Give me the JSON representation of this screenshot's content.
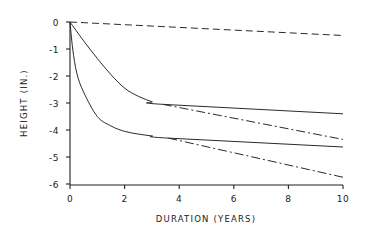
{
  "chart_data": {
    "type": "line",
    "title": "",
    "xlabel": "DURATION (YEARS)",
    "ylabel": "HEIGHT (IN.)",
    "xlim": [
      0,
      10
    ],
    "ylim": [
      -6,
      0
    ],
    "x_ticks": [
      0,
      2,
      4,
      6,
      8,
      10
    ],
    "x_tick_labels": [
      "0",
      "2",
      "4",
      "6",
      "8",
      "10"
    ],
    "y_ticks": [
      0,
      -1,
      -2,
      -3,
      -4,
      -5,
      -6
    ],
    "y_tick_labels": [
      "0",
      "-1",
      "-2",
      "-3",
      "-4",
      "-5",
      "-6"
    ],
    "grid": false,
    "legend": null,
    "series": [
      {
        "name": "dashed-top",
        "style": "dashed",
        "x": [
          0,
          10
        ],
        "y": [
          0,
          -0.5
        ]
      },
      {
        "name": "upper-solid",
        "style": "solid",
        "x": [
          0,
          0.5,
          1,
          1.5,
          2,
          2.5,
          3,
          3.4,
          10
        ],
        "y": [
          0,
          -0.7,
          -1.35,
          -1.95,
          -2.45,
          -2.75,
          -2.95,
          -3.05,
          -3.4
        ]
      },
      {
        "name": "upper-dashdot",
        "style": "dash-dot",
        "x": [
          3.4,
          10
        ],
        "y": [
          -3.05,
          -4.35
        ]
      },
      {
        "name": "lower-solid",
        "style": "solid",
        "x": [
          0,
          0.1,
          0.25,
          0.5,
          1,
          1.5,
          2,
          2.5,
          3,
          3.6,
          10
        ],
        "y": [
          0,
          -1.0,
          -1.9,
          -2.6,
          -3.5,
          -3.85,
          -4.05,
          -4.15,
          -4.22,
          -4.3,
          -4.63
        ]
      },
      {
        "name": "lower-dashdot",
        "style": "dash-dot",
        "x": [
          3.6,
          10
        ],
        "y": [
          -4.3,
          -5.75
        ]
      }
    ]
  },
  "axes": {
    "x_title": "DURATION (YEARS)",
    "y_title": "HEIGHT (IN.)"
  }
}
